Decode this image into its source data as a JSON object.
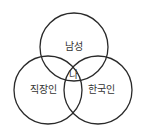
{
  "diagram": {
    "type": "venn",
    "stroke_color": "#2a2a2a",
    "sets": [
      {
        "label": "남성",
        "cx": 74,
        "cy": 47,
        "r": 34
      },
      {
        "label": "직장인",
        "cx": 48,
        "cy": 90,
        "r": 34
      },
      {
        "label": "한국인",
        "cx": 98,
        "cy": 90,
        "r": 34
      }
    ],
    "intersection_label": "나"
  }
}
